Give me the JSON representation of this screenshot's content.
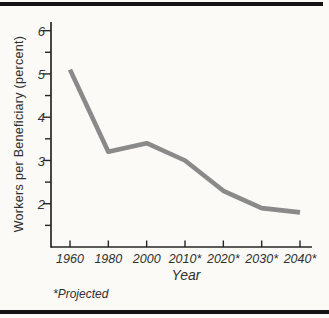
{
  "page": {
    "background_color": "#fbfaf7",
    "rule_color": "#141414",
    "text_color": "#2f2f2f"
  },
  "chart_data": {
    "type": "line",
    "title": "",
    "xlabel": "Year",
    "ylabel": "Workers per Beneficiary (percent)",
    "footnote": "*Projected",
    "categories": [
      "1960",
      "1980",
      "2000",
      "2010*",
      "2020*",
      "2030*",
      "2040*"
    ],
    "values": [
      5.1,
      3.2,
      3.4,
      3.0,
      2.3,
      1.9,
      1.8
    ],
    "y_ticks_major": [
      2,
      3,
      4,
      5,
      6
    ],
    "y_ticks_minor": [
      1.5,
      2.5,
      3.5,
      4.5,
      5.5
    ],
    "ylim": [
      1.0,
      6.2
    ],
    "grid": false,
    "legend": "none",
    "line_color": "#8a8a8a",
    "axis_color": "#262626"
  }
}
